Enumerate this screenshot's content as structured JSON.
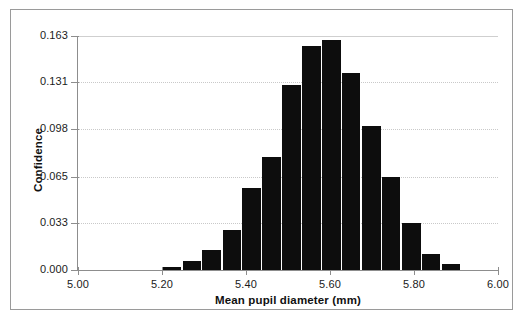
{
  "chart_data": {
    "type": "bar",
    "title": "",
    "subtitle": "",
    "xlabel": "Mean pupil diameter (mm)",
    "ylabel": "Confidence",
    "xlim": [
      5.0,
      6.0
    ],
    "ylim": [
      0.0,
      0.163
    ],
    "xticks": [
      "5.00",
      "5.20",
      "5.40",
      "5.60",
      "5.80",
      "6.00"
    ],
    "xtick_values": [
      5.0,
      5.2,
      5.4,
      5.6,
      5.8,
      6.0
    ],
    "yticks": [
      "0.000",
      "0.033",
      "0.065",
      "0.098",
      "0.131",
      "0.163"
    ],
    "ytick_values": [
      0.0,
      0.033,
      0.065,
      0.098,
      0.131,
      0.163
    ],
    "grid": "horizontal-dotted",
    "legend": "none",
    "bin_width": 0.0475,
    "bar_color": "#0d0d0d",
    "categories": [
      "5.200",
      "5.248",
      "5.295",
      "5.343",
      "5.390",
      "5.438",
      "5.485",
      "5.533",
      "5.580",
      "5.628",
      "5.675",
      "5.723",
      "5.770",
      "5.818",
      "5.865",
      "5.913"
    ],
    "values": [
      0.002,
      0.006,
      0.014,
      0.028,
      0.057,
      0.079,
      0.129,
      0.156,
      0.16,
      0.137,
      0.1,
      0.065,
      0.033,
      0.011,
      0.004,
      0.0
    ],
    "bin_edges": [
      5.2,
      5.248,
      5.295,
      5.343,
      5.39,
      5.438,
      5.485,
      5.533,
      5.58,
      5.628,
      5.675,
      5.723,
      5.77,
      5.818,
      5.865,
      5.913,
      5.96
    ]
  },
  "axes": {
    "x_title": "Mean pupil diameter (mm)",
    "y_title": "Confidence"
  }
}
